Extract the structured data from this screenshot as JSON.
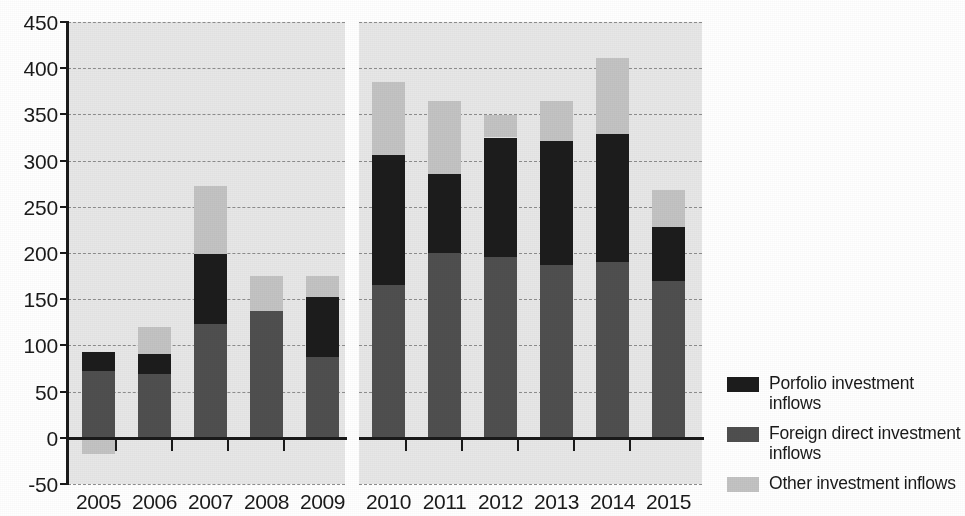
{
  "chart_data": {
    "type": "bar",
    "stacked": true,
    "title": "",
    "subtitle": "",
    "xlabel": "",
    "ylabel": "",
    "ylim": [
      -50,
      450
    ],
    "yticks": [
      -50,
      0,
      50,
      100,
      150,
      200,
      250,
      300,
      350,
      400,
      450
    ],
    "ytick_labels": [
      "-50",
      "0",
      "50",
      "100",
      "150",
      "200",
      "250",
      "300",
      "350",
      "400",
      "450"
    ],
    "grid": true,
    "grid_style": "dashed-horizontal",
    "legend_position": "right",
    "panels": [
      {
        "name": "panel-left",
        "categories": [
          "2005",
          "2006",
          "2007",
          "2008",
          "2009"
        ]
      },
      {
        "name": "panel-right",
        "categories": [
          "2010",
          "2011",
          "2012",
          "2013",
          "2014",
          "2015"
        ]
      }
    ],
    "categories": [
      "2005",
      "2006",
      "2007",
      "2008",
      "2009",
      "2010",
      "2011",
      "2012",
      "2013",
      "2014",
      "2015"
    ],
    "series": [
      {
        "name": "Foreign direct investment inflows",
        "color": "#4f4f4f",
        "values": [
          72,
          69,
          123,
          137,
          87,
          165,
          200,
          196,
          187,
          190,
          170
        ]
      },
      {
        "name": "Porfolio investment inflows",
        "color": "#1c1c1c",
        "values": [
          21,
          22,
          76,
          0,
          65,
          141,
          85,
          129,
          134,
          139,
          58
        ]
      },
      {
        "name": "Other investment inflows",
        "color": "#c3c3c3",
        "values": [
          -18,
          29,
          74,
          38,
          23,
          79,
          79,
          24,
          44,
          82,
          40
        ]
      }
    ],
    "totals": [
      93,
      120,
      273,
      175,
      175,
      385,
      364,
      349,
      365,
      411,
      268
    ]
  },
  "legend": {
    "items": [
      {
        "label": "Porfolio investment inflows",
        "color": "#1c1c1c",
        "swatch": "legend-swatch-portfolio"
      },
      {
        "label": "Foreign direct investment inflows",
        "color": "#4f4f4f",
        "swatch": "legend-swatch-fdi"
      },
      {
        "label": "Other investment inflows",
        "color": "#c3c3c3",
        "swatch": "legend-swatch-other"
      }
    ]
  },
  "axes": {
    "y_tick_labels": [
      "450",
      "400",
      "350",
      "300",
      "250",
      "200",
      "150",
      "100",
      "50",
      "0",
      "-50"
    ],
    "x_tick_labels_left": [
      "2005",
      "2006",
      "2007",
      "2008",
      "2009"
    ],
    "x_tick_labels_right": [
      "2010",
      "2011",
      "2012",
      "2013",
      "2014",
      "2015"
    ]
  },
  "colors": {
    "plot_background": "#e7e7e7",
    "axis": "#1a1a1a",
    "gridline": "#8d8d8d",
    "portfolio": "#1c1c1c",
    "fdi": "#4f4f4f",
    "other": "#c3c3c3"
  }
}
